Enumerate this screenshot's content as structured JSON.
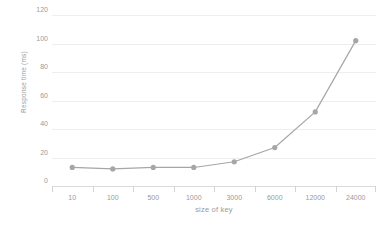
{
  "chart_data": {
    "type": "line",
    "title": "",
    "xlabel": "size of key",
    "ylabel": "Response time (ms)",
    "categories": [
      "10",
      "100",
      "500",
      "1000",
      "3000",
      "6000",
      "12000",
      "24000"
    ],
    "values": [
      13,
      12,
      13,
      13,
      17,
      27,
      52,
      102
    ],
    "series": [
      {
        "name": "Response time (ms)",
        "values": [
          13,
          12,
          13,
          13,
          17,
          27,
          52,
          102
        ]
      }
    ],
    "ylim": [
      0,
      120
    ],
    "yticks": [
      0,
      20,
      40,
      60,
      80,
      100,
      120
    ],
    "ytick_labels": [
      "0",
      "20",
      "40",
      "60",
      "80",
      "100",
      "120"
    ],
    "grid": "horizontal",
    "legend": "none",
    "line_color": "#a6a6a6",
    "marker_color": "#a6a6a6",
    "marker_shape": "circle",
    "gridline_color": "#eceff2",
    "axis_text_color": "#9a9a9a",
    "background_color": "#ffffff"
  }
}
